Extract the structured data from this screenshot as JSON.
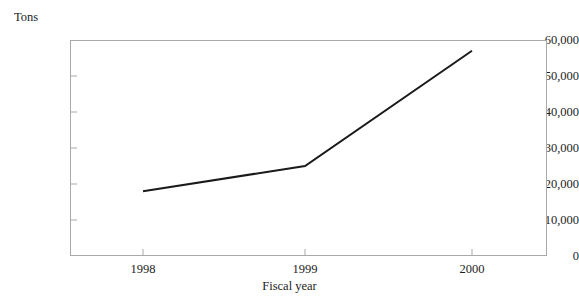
{
  "chart_data": {
    "type": "line",
    "title": "",
    "subtitle": "",
    "xlabel": "Fiscal year",
    "ylabel": "Tons",
    "categories": [
      "1998",
      "1999",
      "2000"
    ],
    "x": [
      1998,
      1999,
      2000
    ],
    "values": [
      18000,
      25000,
      57000
    ],
    "series": [
      {
        "name": "Tons",
        "values": [
          18000,
          25000,
          57000
        ],
        "color": "#1a1a1a"
      }
    ],
    "ylim": [
      0,
      60000
    ],
    "yticks": [
      0,
      10000,
      20000,
      30000,
      40000,
      50000,
      60000
    ],
    "ytick_labels": [
      "0",
      "10,000",
      "20,000",
      "30,000",
      "40,000",
      "50,000",
      "60,000"
    ],
    "xtick_labels": [
      "1998",
      "1999",
      "2000"
    ],
    "grid": false,
    "legend": false,
    "legend_position": "none",
    "markers": false,
    "line_width": 2,
    "frame_color": "#a9a9a9",
    "background_color": "#ffffff",
    "text_color": "#1d1d1d"
  }
}
